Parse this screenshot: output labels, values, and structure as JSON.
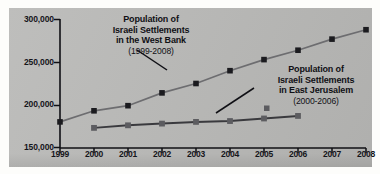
{
  "chart_data": {
    "type": "line",
    "title": "",
    "xlabel": "",
    "ylabel": "",
    "grid": false,
    "legend_position": "inline-annotations",
    "x": [
      1999,
      2000,
      2001,
      2002,
      2003,
      2004,
      2005,
      2006,
      2007,
      2008
    ],
    "xtick_labels": [
      "1999",
      "2000",
      "2001",
      "2002",
      "2003",
      "2004",
      "2005",
      "2006",
      "2007",
      "2008"
    ],
    "ytick_labels": [
      "300,000",
      "250,000",
      "200,000",
      "150,000"
    ],
    "ytick_values": [
      300000,
      250000,
      200000,
      150000
    ],
    "ylim": [
      150000,
      300000
    ],
    "xlim": [
      1999,
      2008
    ],
    "series": [
      {
        "name": "Population of Israeli Settlements in the West Bank",
        "years": "(1999-2008)",
        "color": "#1b1b1f",
        "line_color": "#6d6d70",
        "marker": "square",
        "x": [
          1999,
          2000,
          2001,
          2002,
          2003,
          2004,
          2005,
          2006,
          2007,
          2008
        ],
        "values": [
          180000,
          193000,
          199000,
          214000,
          225000,
          240000,
          253000,
          264000,
          277000,
          288000
        ]
      },
      {
        "name": "Population of Israeli Settlements in East Jerusalem",
        "years": "(2000-2006)",
        "color": "#5c5c60",
        "line_color": "#3a3a3e",
        "marker": "square",
        "x": [
          2000,
          2001,
          2002,
          2003,
          2004,
          2005,
          2006
        ],
        "values": [
          173000,
          176000,
          178000,
          180000,
          181000,
          184000,
          187000
        ]
      }
    ],
    "annotations": [
      {
        "id": "west-bank",
        "lines": [
          "Population of",
          "Israeli Settlements",
          "in the West Bank"
        ],
        "years": "(1999-2008)",
        "points_to_year": 2002
      },
      {
        "id": "east-jerusalem",
        "lines": [
          "Population of",
          "Israeli Settlements",
          "in East Jerusalem"
        ],
        "years": "(2000-2006)",
        "points_to_year": 2004
      }
    ]
  },
  "colors": {
    "panel_background": "#b9b9b7",
    "page_background": "#fdfdfb",
    "axis": "#101015",
    "text": "#101015",
    "west_bank_marker": "#1b1b1f",
    "west_bank_line": "#6d6d70",
    "east_jerusalem_marker": "#5c5c60",
    "east_jerusalem_line": "#3a3a3e"
  }
}
